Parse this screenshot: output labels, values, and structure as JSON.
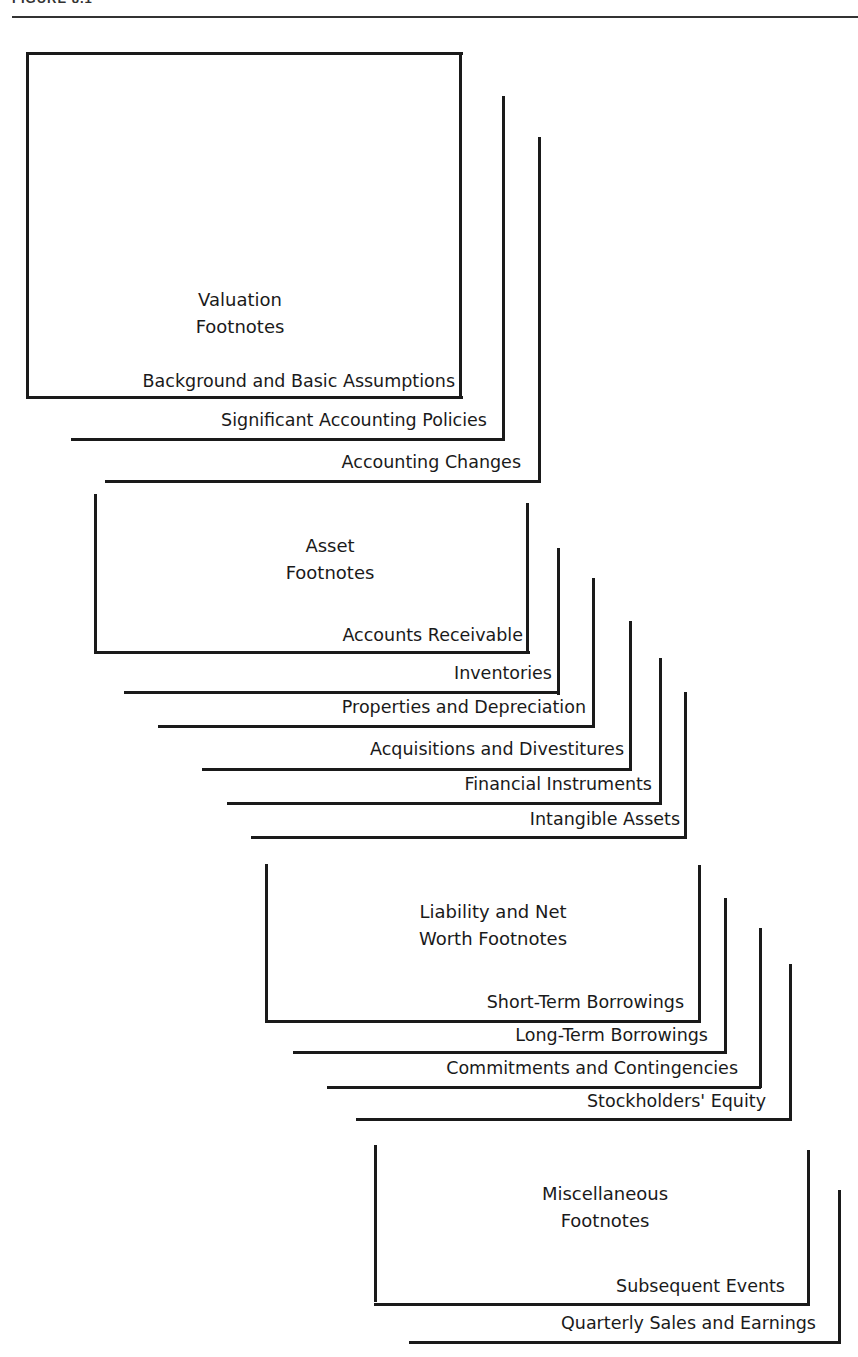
{
  "figure": {
    "header": "FIGURE 8.1"
  },
  "groups": [
    {
      "title": [
        "Valuation",
        "Footnotes"
      ],
      "items": [
        "Background and Basic Assumptions",
        "Significant Accounting Policies",
        "Accounting Changes"
      ]
    },
    {
      "title": [
        "Asset",
        "Footnotes"
      ],
      "items": [
        "Accounts Receivable",
        "Inventories",
        "Properties and Depreciation",
        "Acquisitions and Divestitures",
        "Financial Instruments",
        "Intangible Assets"
      ]
    },
    {
      "title": [
        "Liability and Net",
        "Worth Footnotes"
      ],
      "items": [
        "Short-Term Borrowings",
        "Long-Term Borrowings",
        "Commitments and Contingencies",
        "Stockholders' Equity"
      ]
    },
    {
      "title": [
        "Miscellaneous",
        "Footnotes"
      ],
      "items": [
        "Subsequent Events",
        "Quarterly Sales and Earnings"
      ]
    }
  ],
  "colors": {
    "line": "#1a1a1a",
    "background": "#ffffff"
  }
}
